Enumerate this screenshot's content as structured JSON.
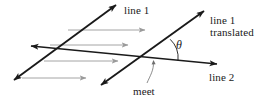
{
  "figure": {
    "background_color": "#ffffff",
    "width": 264,
    "height": 99,
    "labels": {
      "line1": "line 1",
      "line1_translated_part1": "line 1",
      "line1_translated_part2": "translated",
      "line2": "line 2",
      "meet": "meet",
      "theta": "θ"
    },
    "colors": {
      "line_stroke": "#1a1a1a",
      "translation_arrow_stroke": "#9a9a9a",
      "leader_stroke": "#6e6e6e",
      "text": "#1a1a1a"
    },
    "geometry": {
      "line1": {
        "name": "line 1",
        "description": "original slanted line, double headed arrow pointing up-right and down-left",
        "x1": 14,
        "y1": 80,
        "x2": 116,
        "y2": 5
      },
      "line1_translated": {
        "name": "line 1 translated",
        "description": "parallel copy of line 1 shifted to the right, double headed arrow",
        "x1": 101,
        "y1": 85,
        "x2": 204,
        "y2": 11
      },
      "line2": {
        "name": "line 2",
        "description": "shallow line crossing both, double headed arrow pointing left and right",
        "x1": 31,
        "y1": 46,
        "x2": 217,
        "y2": 64
      },
      "intersection_meet": {
        "x": 152,
        "y": 58
      },
      "intersection_line1_line2": {
        "x": 65,
        "y": 49
      },
      "angle_arc": {
        "label": "θ",
        "vertex_x": 152,
        "vertex_y": 58,
        "radius": 26
      },
      "translation_arrows": [
        {
          "x1": 68,
          "y1": 30,
          "x2": 145,
          "y2": 30
        },
        {
          "x1": 50,
          "y1": 45,
          "x2": 128,
          "y2": 45
        },
        {
          "x1": 44,
          "y1": 61,
          "x2": 118,
          "y2": 61
        },
        {
          "x1": 22,
          "y1": 78,
          "x2": 86,
          "y2": 78
        }
      ],
      "meet_leader": {
        "x1": 147,
        "y1": 83,
        "x2": 155,
        "y2": 62
      }
    }
  }
}
